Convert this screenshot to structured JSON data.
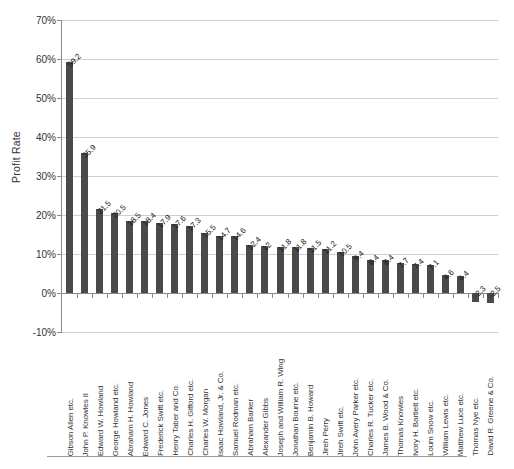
{
  "chart_data": {
    "type": "bar",
    "title": "",
    "subtitle": "",
    "xlabel": "",
    "ylabel": "Profit Rate",
    "ylim": [
      -10,
      70
    ],
    "ytick_labels": [
      "70%",
      "60%",
      "50%",
      "40%",
      "30%",
      "20%",
      "10%",
      "0%",
      "-10%"
    ],
    "ytick_values": [
      70,
      60,
      50,
      40,
      30,
      20,
      10,
      0,
      -10
    ],
    "grid": true,
    "legend": false,
    "legend_position": "none",
    "value_labels_shown": true,
    "value_label_rotation": "-45deg",
    "bar_color": "#4a4a4a",
    "gridline_color": "#cfcfcf",
    "axis_color": "#8a8a8a",
    "categories": [
      "Gibson Allen etc.",
      "John P. Knowles II",
      "Edward W. Howland",
      "George Howland etc.",
      "Abraham H. Howland",
      "Edward C. Jones",
      "Frederick Swift etc.",
      "Henry Taber and Co.",
      "Charles H. Gifford etc.",
      "Charles W. Morgan",
      "Isaac Howland, Jr. & Co.",
      "Samuel Rodman etc.",
      "Abraham Barker",
      "Alexander Gibbs",
      "Joseph and William R. Wing",
      "Jonathan Bourne etc.",
      "Benjamin B. Howard",
      "Jireh Perry",
      "Jireh Swift etc.",
      "John Avery Parker etc.",
      "Charles R. Tucker etc.",
      "James B. Wood & Co.",
      "Thomas Knowles",
      "Ivory H. Bartlett etc.",
      "Loum Snow etc.",
      "William Lewis etc.",
      "Matthew Luce etc.",
      "Thomas Nye etc.",
      "David R. Greene & Co."
    ],
    "values": [
      59.2,
      35.9,
      21.5,
      20.5,
      18.5,
      18.4,
      17.9,
      17.6,
      17.3,
      15.5,
      14.7,
      14.6,
      12.4,
      12,
      11.8,
      11.8,
      11.5,
      11.2,
      10.5,
      9.4,
      8.4,
      8.4,
      7.7,
      7.4,
      7.1,
      4.6,
      4.4,
      -2.3,
      -2.5
    ],
    "value_labels": [
      "59.2",
      "35.9",
      "21.5",
      "20.5",
      "18.5",
      "18.4",
      "17.9",
      "17.6",
      "17.3",
      "15.5",
      "14.7",
      "14.6",
      "12.4",
      "12",
      "11.8",
      "11.8",
      "11.5",
      "11.2",
      "10.5",
      "9.4",
      "8.4",
      "8.4",
      "7.7",
      "7.4",
      "7.1",
      "4.6",
      "4.4",
      "-2.3",
      "-2.5"
    ]
  }
}
